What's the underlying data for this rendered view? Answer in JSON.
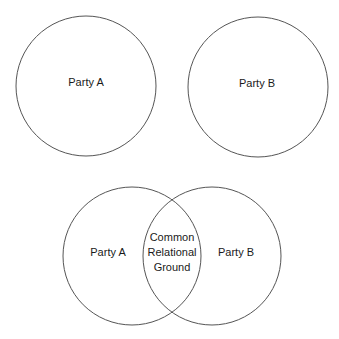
{
  "top_diagram": {
    "left_circle": {
      "label": "Party A",
      "cx": 86,
      "cy": 86,
      "r": 70
    },
    "right_circle": {
      "label": "Party B",
      "cx": 258,
      "cy": 87,
      "r": 70
    }
  },
  "bottom_diagram": {
    "left_circle": {
      "label": "Party A",
      "cx": 132,
      "cy": 256,
      "r": 69
    },
    "right_circle": {
      "label": "Party B",
      "cx": 212,
      "cy": 256,
      "r": 69
    },
    "overlap": {
      "lines": [
        "Common",
        "Relational",
        "Ground"
      ]
    }
  },
  "colors": {
    "stroke": "#555555",
    "text": "#1a1a1a",
    "background": "#ffffff"
  }
}
